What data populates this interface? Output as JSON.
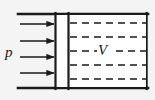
{
  "figure": {
    "type": "schematic",
    "width": 155,
    "height": 100,
    "background_color": "#f4f4f4",
    "stroke_color": "#1a1a1a"
  },
  "labels": {
    "pressure": "p",
    "volume": "V"
  },
  "geometry": {
    "wall_top": {
      "x1": 18,
      "y1": 14,
      "x2": 148,
      "y2": 14,
      "width": 2.6
    },
    "wall_bottom": {
      "x1": 18,
      "y1": 88,
      "x2": 148,
      "y2": 88,
      "width": 2.6
    },
    "wall_right": {
      "x1": 146.6,
      "y1": 13,
      "x2": 146.6,
      "y2": 89,
      "width": 2.2
    },
    "piston_left_face": {
      "x1": 55.5,
      "y1": 13,
      "x2": 55.5,
      "y2": 89,
      "width": 2.2
    },
    "piston_right_face": {
      "x1": 68.5,
      "y1": 13,
      "x2": 68.5,
      "y2": 89,
      "width": 2.2
    }
  },
  "arrows": {
    "count": 4,
    "direction": "right",
    "meaning": "applied pressure p",
    "x_start": 20,
    "x_end": 55,
    "y_positions": [
      24,
      41,
      57,
      73
    ],
    "stroke_width": 1.6,
    "head_length": 7,
    "head_half_width": 3.2
  },
  "dashed_lines": {
    "count": 5,
    "meaning": "gas volume V interior hatching",
    "x_start": 70,
    "x_end": 146,
    "y_positions": [
      23,
      37,
      51,
      65,
      79
    ],
    "dash_pattern": "7 5",
    "stroke_width": 1.6,
    "gap_for_label": {
      "line_index": 2,
      "x_start": 97,
      "x_end": 116
    }
  }
}
